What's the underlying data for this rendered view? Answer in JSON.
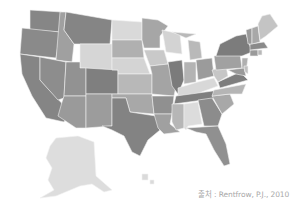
{
  "map": {
    "title": "",
    "type": "choropleth",
    "region": "United States",
    "palette": {
      "darkest": "#7d7d7d",
      "dark": "#8f8f8f",
      "mid": "#a3a3a3",
      "light": "#bdbdbd",
      "lightest": "#d8d8d8"
    },
    "states": [
      {
        "id": "WA",
        "shade": "#868686",
        "d": "M30,10 L62,12 L60,32 L30,30 Z"
      },
      {
        "id": "OR",
        "shade": "#8a8a8a",
        "d": "M22,28 L60,32 L56,58 L20,54 Z"
      },
      {
        "id": "CA",
        "shade": "#858585",
        "d": "M20,54 L40,57 L40,80 L70,112 L64,122 L46,118 L32,96 L22,74 Z"
      },
      {
        "id": "ID",
        "shade": "#a0a0a0",
        "d": "M60,12 L66,12 L64,30 L74,44 L72,62 L56,60 Z"
      },
      {
        "id": "NV",
        "shade": "#8d8d8d",
        "d": "M40,57 L66,62 L64,98 L58,100 L40,80 Z"
      },
      {
        "id": "MT",
        "shade": "#858585",
        "d": "M66,12 L112,20 L110,44 L74,44 L64,30 Z"
      },
      {
        "id": "WY",
        "shade": "#d6d6d6",
        "d": "M80,44 L112,44 L112,70 L80,68 Z"
      },
      {
        "id": "UT",
        "shade": "#929292",
        "d": "M66,62 L80,62 L80,68 L86,68 L86,96 L64,96 Z"
      },
      {
        "id": "AZ",
        "shade": "#9a9a9a",
        "d": "M64,96 L86,96 L86,128 L76,128 L58,116 L62,102 Z"
      },
      {
        "id": "CO",
        "shade": "#7f7f7f",
        "d": "M86,68 L118,70 L118,94 L86,94 Z"
      },
      {
        "id": "NM",
        "shade": "#9c9c9c",
        "d": "M86,94 L112,94 L112,126 L86,128 Z"
      },
      {
        "id": "ND",
        "shade": "#d9d9d9",
        "d": "M112,20 L142,22 L142,40 L112,40 Z"
      },
      {
        "id": "SD",
        "shade": "#b0b0b0",
        "d": "M112,40 L142,40 L144,58 L112,58 Z"
      },
      {
        "id": "NE",
        "shade": "#d4d4d4",
        "d": "M112,58 L144,58 L150,74 L118,74 L118,70 L112,70 Z"
      },
      {
        "id": "KS",
        "shade": "#b8b8b8",
        "d": "M118,74 L152,74 L152,94 L118,94 Z"
      },
      {
        "id": "OK",
        "shade": "#a8a8a8",
        "d": "M112,94 L152,94 L154,114 L130,112 L126,98 L112,98 Z"
      },
      {
        "id": "TX",
        "shade": "#838383",
        "d": "M112,98 L126,98 L130,112 L156,116 L160,130 L148,140 L140,156 L132,152 L124,136 L112,130 L102,126 L112,126 Z"
      },
      {
        "id": "MN",
        "shade": "#a6a6a6",
        "d": "M142,18 L158,20 L168,26 L160,36 L160,48 L144,48 L142,40 Z"
      },
      {
        "id": "IA",
        "shade": "#c9c9c9",
        "d": "M144,50 L164,50 L168,64 L150,66 Z"
      },
      {
        "id": "MO",
        "shade": "#a4a4a4",
        "d": "M150,66 L168,64 L176,86 L174,96 L152,94 L152,74 Z"
      },
      {
        "id": "AR",
        "shade": "#909090",
        "d": "M152,96 L174,96 L172,114 L154,114 Z"
      },
      {
        "id": "LA",
        "shade": "#a0a0a0",
        "d": "M154,114 L172,114 L170,124 L180,132 L164,134 L158,128 Z"
      },
      {
        "id": "WI",
        "shade": "#d3d3d3",
        "d": "M162,30 L180,34 L182,54 L166,52 L164,40 Z"
      },
      {
        "id": "IL",
        "shade": "#7b7b7b",
        "d": "M168,62 L182,60 L184,80 L178,94 L172,86 Z"
      },
      {
        "id": "MI",
        "shade": "#b9b9b9",
        "d": "M188,40 L200,42 L202,58 L190,60 Z M172,32 L196,34 L186,38 Z"
      },
      {
        "id": "IN",
        "shade": "#b3b3b3",
        "d": "M184,62 L196,62 L196,82 L184,84 Z"
      },
      {
        "id": "OH",
        "shade": "#9b9b9b",
        "d": "M196,60 L212,58 L214,76 L198,80 Z"
      },
      {
        "id": "KY",
        "shade": "#d8d8d8",
        "d": "M178,88 L198,82 L214,78 L218,86 L196,94 L178,96 Z"
      },
      {
        "id": "TN",
        "shade": "#7f7f7f",
        "d": "M176,96 L220,90 L218,98 L174,104 Z"
      },
      {
        "id": "MS",
        "shade": "#b6b6b6",
        "d": "M172,104 L184,104 L184,128 L176,130 L172,122 Z"
      },
      {
        "id": "AL",
        "shade": "#dcdcdc",
        "d": "M184,104 L198,102 L202,124 L188,126 L186,130 L184,128 Z"
      },
      {
        "id": "GA",
        "shade": "#8c8c8c",
        "d": "M198,100 L212,98 L222,114 L218,126 L204,126 Z"
      },
      {
        "id": "FL",
        "shade": "#909090",
        "d": "M186,128 L218,126 L226,144 L230,164 L224,166 L214,150 L206,134 L196,132 Z"
      },
      {
        "id": "SC",
        "shade": "#a8a8a8",
        "d": "M212,96 L230,94 L234,104 L222,114 Z"
      },
      {
        "id": "NC",
        "shade": "#b5b5b5",
        "d": "M214,90 L246,84 L242,94 L230,94 L212,96 Z"
      },
      {
        "id": "VA",
        "shade": "#7e7e7e",
        "d": "M218,82 L240,72 L248,80 L220,88 Z"
      },
      {
        "id": "WV",
        "shade": "#c6c6c6",
        "d": "M212,70 L226,66 L228,76 L218,82 L214,76 Z"
      },
      {
        "id": "PA",
        "shade": "#a1a1a1",
        "d": "M214,56 L240,54 L242,68 L216,70 Z"
      },
      {
        "id": "NY",
        "shade": "#7c7c7c",
        "d": "M220,44 L236,36 L246,34 L252,52 L242,56 L216,56 Z"
      },
      {
        "id": "NJ",
        "shade": "#b0b0b0",
        "d": "M242,58 L248,58 L246,72 L242,68 Z"
      },
      {
        "id": "MD",
        "shade": "#999999",
        "d": "M228,70 L244,68 L246,76 L236,74 Z"
      },
      {
        "id": "DE",
        "shade": "#c0c0c0",
        "d": "M244,66 L248,66 L248,74 L245,72 Z"
      },
      {
        "id": "CT",
        "shade": "#9a9a9a",
        "d": "M250,50 L258,50 L258,56 L250,56 Z"
      },
      {
        "id": "RI",
        "shade": "#b8b8b8",
        "d": "M258,50 L262,50 L262,55 L258,55 Z"
      },
      {
        "id": "MA",
        "shade": "#8a8a8a",
        "d": "M250,44 L264,42 L268,48 L250,50 Z"
      },
      {
        "id": "VT",
        "shade": "#9a9a9a",
        "d": "M246,30 L252,28 L252,44 L248,44 Z"
      },
      {
        "id": "NH",
        "shade": "#a8a8a8",
        "d": "M252,28 L258,26 L260,42 L252,44 Z"
      },
      {
        "id": "ME",
        "shade": "#c4c4c4",
        "d": "M258,24 L262,16 L270,14 L278,26 L266,36 L260,40 Z"
      },
      {
        "id": "AK",
        "shade": "#dddddd",
        "d": "M56,138 L78,136 L94,142 L96,176 L112,190 L104,192 L92,184 L80,186 L56,196 L40,198 L54,190 L48,180 L52,168 L46,158 L50,146 Z"
      },
      {
        "id": "HI",
        "shade": "#dadada",
        "d": "M142,174 L148,174 L148,180 L142,180 Z M150,180 L154,180 L154,184 L150,184 Z"
      }
    ]
  },
  "caption": {
    "text": "출처 : Rentfrow, P.J., 2010"
  }
}
